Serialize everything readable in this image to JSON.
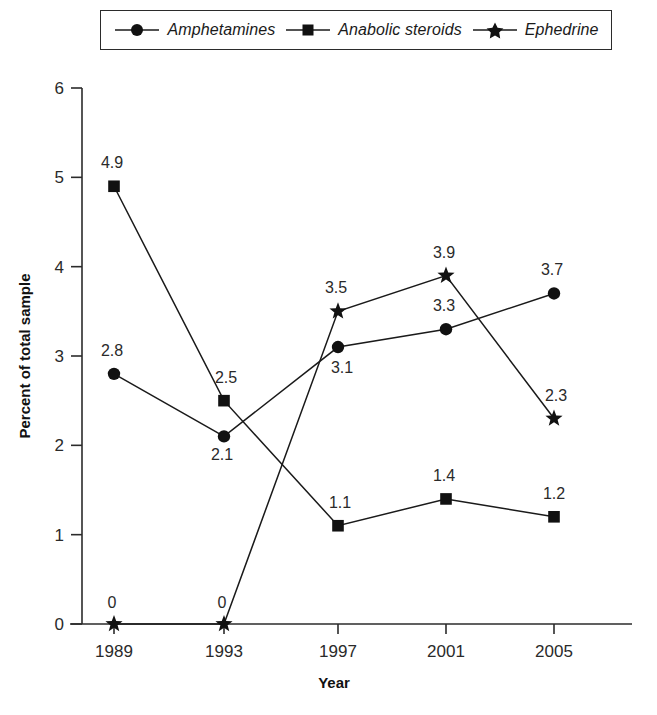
{
  "legend": {
    "position": "top",
    "items": [
      {
        "label": "Amphetamines",
        "marker": "circle-marker-icon"
      },
      {
        "label": "Anabolic steroids",
        "marker": "square-marker-icon"
      },
      {
        "label": "Ephedrine",
        "marker": "star-marker-icon"
      }
    ]
  },
  "chart_data": {
    "type": "line",
    "title": "",
    "subtitle": "",
    "xlabel": "Year",
    "ylabel": "Percent of total sample",
    "categories": [
      "1989",
      "1993",
      "1997",
      "2001",
      "2005"
    ],
    "x": [
      1989,
      1993,
      1997,
      2001,
      2005
    ],
    "ylim": [
      0,
      6
    ],
    "yticks": [
      0,
      1,
      2,
      3,
      4,
      5,
      6
    ],
    "ytick_labels": [
      "0",
      "1",
      "2",
      "3",
      "4",
      "5",
      "6"
    ],
    "grid": false,
    "legend_position": "top",
    "series": [
      {
        "name": "Amphetamines",
        "marker": "circle",
        "color": "#111111",
        "values": [
          2.8,
          2.1,
          3.1,
          3.3,
          3.7
        ],
        "data_labels": [
          "2.8",
          "2.1",
          "3.1",
          "3.3",
          "3.7"
        ]
      },
      {
        "name": "Anabolic steroids",
        "marker": "square",
        "color": "#111111",
        "values": [
          4.9,
          2.5,
          1.1,
          1.4,
          1.2
        ],
        "data_labels": [
          "4.9",
          "2.5",
          "1.1",
          "1.4",
          "1.2"
        ]
      },
      {
        "name": "Ephedrine",
        "marker": "star",
        "color": "#111111",
        "values": [
          0,
          0,
          3.5,
          3.9,
          2.3
        ],
        "data_labels": [
          "0",
          "0",
          "3.5",
          "3.9",
          "2.3"
        ]
      }
    ],
    "label_offsets": [
      {
        "series": "Amphetamines",
        "dx": [
          -2,
          -2,
          4,
          -2,
          -2
        ],
        "dy": [
          -18,
          24,
          26,
          -18,
          -18
        ]
      },
      {
        "series": "Anabolic steroids",
        "dx": [
          -2,
          2,
          2,
          -2,
          0
        ],
        "dy": [
          -18,
          -18,
          -18,
          -18,
          -18
        ]
      },
      {
        "series": "Ephedrine",
        "dx": [
          -2,
          -2,
          -2,
          -2,
          2
        ],
        "dy": [
          -16,
          -16,
          -18,
          -18,
          -18
        ]
      }
    ]
  }
}
